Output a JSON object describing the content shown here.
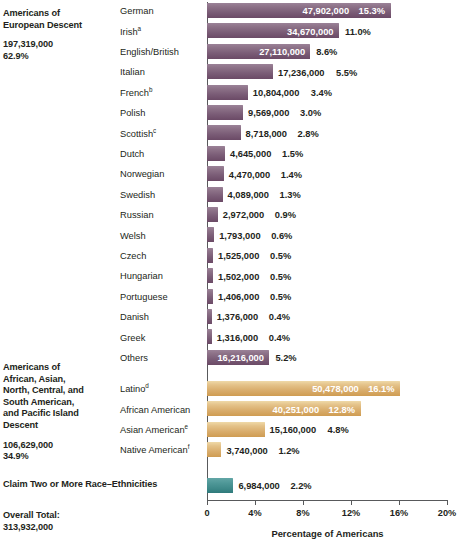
{
  "groups": [
    {
      "name": "european",
      "title_lines": [
        "Americans of",
        "European Descent"
      ],
      "total": "197,319,000",
      "percent": "62.9%"
    },
    {
      "name": "african-asian-american-pacific",
      "title_lines": [
        "Americans of",
        "African, Asian,",
        "North, Central, and",
        "South American,",
        "and Pacific Island",
        "Descent"
      ],
      "total": "106,629,000",
      "percent": "34.9%"
    },
    {
      "name": "two-or-more",
      "title_lines": [
        "Claim Two or More Race–Ethnicities"
      ],
      "total": "",
      "percent": ""
    },
    {
      "name": "overall-total",
      "title_lines": [
        "Overall Total:",
        "313,932,000"
      ],
      "total": "",
      "percent": ""
    }
  ],
  "chart_data": {
    "type": "bar",
    "title": "",
    "xlabel": "Percentage of Americans",
    "ylabel": "",
    "xlim": [
      0,
      20
    ],
    "xticks": [
      0,
      4,
      8,
      12,
      16,
      20
    ],
    "xtick_labels": [
      "0",
      "4%",
      "8%",
      "12%",
      "16%",
      "20%"
    ],
    "grid": false,
    "legend": "none",
    "orientation": "horizontal",
    "series": [
      {
        "name": "Americans of European Descent",
        "color": "#7b5d77",
        "items": [
          {
            "label": "German",
            "sup": "",
            "value": "47,902,000",
            "percent": "15.3%",
            "pct_num": 15.3,
            "value_inside": true,
            "percent_inside": true
          },
          {
            "label": "Irish",
            "sup": "a",
            "value": "34,670,000",
            "percent": "11.0%",
            "pct_num": 11.0,
            "value_inside": true,
            "percent_inside": false
          },
          {
            "label": "English/British",
            "sup": "",
            "value": "27,110,000",
            "percent": "8.6%",
            "pct_num": 8.6,
            "value_inside": true,
            "percent_inside": false
          },
          {
            "label": "Italian",
            "sup": "",
            "value": "17,236,000",
            "percent": "5.5%",
            "pct_num": 5.5,
            "value_inside": false,
            "percent_inside": false
          },
          {
            "label": "French",
            "sup": "b",
            "value": "10,804,000",
            "percent": "3.4%",
            "pct_num": 3.4,
            "value_inside": false,
            "percent_inside": false
          },
          {
            "label": "Polish",
            "sup": "",
            "value": "9,569,000",
            "percent": "3.0%",
            "pct_num": 3.0,
            "value_inside": false,
            "percent_inside": false
          },
          {
            "label": "Scottish",
            "sup": "c",
            "value": "8,718,000",
            "percent": "2.8%",
            "pct_num": 2.8,
            "value_inside": false,
            "percent_inside": false
          },
          {
            "label": "Dutch",
            "sup": "",
            "value": "4,645,000",
            "percent": "1.5%",
            "pct_num": 1.5,
            "value_inside": false,
            "percent_inside": false
          },
          {
            "label": "Norwegian",
            "sup": "",
            "value": "4,470,000",
            "percent": "1.4%",
            "pct_num": 1.4,
            "value_inside": false,
            "percent_inside": false
          },
          {
            "label": "Swedish",
            "sup": "",
            "value": "4,089,000",
            "percent": "1.3%",
            "pct_num": 1.3,
            "value_inside": false,
            "percent_inside": false
          },
          {
            "label": "Russian",
            "sup": "",
            "value": "2,972,000",
            "percent": "0.9%",
            "pct_num": 0.9,
            "value_inside": false,
            "percent_inside": false
          },
          {
            "label": "Welsh",
            "sup": "",
            "value": "1,793,000",
            "percent": "0.6%",
            "pct_num": 0.6,
            "value_inside": false,
            "percent_inside": false
          },
          {
            "label": "Czech",
            "sup": "",
            "value": "1,525,000",
            "percent": "0.5%",
            "pct_num": 0.5,
            "value_inside": false,
            "percent_inside": false
          },
          {
            "label": "Hungarian",
            "sup": "",
            "value": "1,502,000",
            "percent": "0.5%",
            "pct_num": 0.5,
            "value_inside": false,
            "percent_inside": false
          },
          {
            "label": "Portuguese",
            "sup": "",
            "value": "1,406,000",
            "percent": "0.5%",
            "pct_num": 0.5,
            "value_inside": false,
            "percent_inside": false
          },
          {
            "label": "Danish",
            "sup": "",
            "value": "1,376,000",
            "percent": "0.4%",
            "pct_num": 0.4,
            "value_inside": false,
            "percent_inside": false
          },
          {
            "label": "Greek",
            "sup": "",
            "value": "1,316,000",
            "percent": "0.4%",
            "pct_num": 0.4,
            "value_inside": false,
            "percent_inside": false
          },
          {
            "label": "Others",
            "sup": "",
            "value": "16,216,000",
            "percent": "5.2%",
            "pct_num": 5.2,
            "value_inside": true,
            "percent_inside": false
          }
        ]
      },
      {
        "name": "Americans of African, Asian, North, Central, and South American, and Pacific Island Descent",
        "color": "#d9ad6c",
        "items": [
          {
            "label": "Latino",
            "sup": "d",
            "value": "50,478,000",
            "percent": "16.1%",
            "pct_num": 16.1,
            "value_inside": true,
            "percent_inside": true
          },
          {
            "label": "African American",
            "sup": "",
            "value": "40,251,000",
            "percent": "12.8%",
            "pct_num": 12.8,
            "value_inside": true,
            "percent_inside": true
          },
          {
            "label": "Asian American",
            "sup": "e",
            "value": "15,160,000",
            "percent": "4.8%",
            "pct_num": 4.8,
            "value_inside": false,
            "percent_inside": false
          },
          {
            "label": "Native American",
            "sup": "f",
            "value": "3,740,000",
            "percent": "1.2%",
            "pct_num": 1.2,
            "value_inside": false,
            "percent_inside": false
          }
        ]
      },
      {
        "name": "Claim Two or More Race–Ethnicities",
        "color": "#3c8787",
        "items": [
          {
            "label": "",
            "sup": "",
            "value": "6,984,000",
            "percent": "2.2%",
            "pct_num": 2.2,
            "value_inside": false,
            "percent_inside": false
          }
        ]
      }
    ]
  }
}
